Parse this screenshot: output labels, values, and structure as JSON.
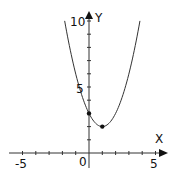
{
  "chart_data": {
    "type": "line",
    "title": "",
    "xlabel": "X",
    "ylabel": "Y",
    "function": "y = x^2 - 2x + 3",
    "xlim": [
      -5.5,
      5.5
    ],
    "ylim": [
      0,
      10
    ],
    "x_tick_labels": [
      "-5",
      "0",
      "5"
    ],
    "y_tick_labels": [
      "5",
      "10"
    ],
    "x_ticks": [
      -5,
      -4,
      -3,
      -2,
      -1,
      0,
      1,
      2,
      3,
      4,
      5
    ],
    "y_ticks": [
      1,
      2,
      3,
      4,
      5,
      6,
      7,
      8,
      9,
      10
    ],
    "grid": false,
    "series": [
      {
        "name": "parabola",
        "x": [
          -1.83,
          -1.5,
          -1,
          -0.5,
          0,
          0.5,
          1,
          1.5,
          2,
          2.5,
          3,
          3.5,
          3.83
        ],
        "y": [
          10,
          8.25,
          6,
          4.25,
          3,
          2.25,
          2,
          2.25,
          3,
          4.25,
          6,
          8.25,
          10
        ]
      }
    ],
    "points": [
      {
        "name": "y-intercept",
        "x": 0,
        "y": 3
      },
      {
        "name": "vertex",
        "x": 1,
        "y": 2
      }
    ]
  },
  "labels": {
    "x_axis": "X",
    "y_axis": "Y",
    "x_min": "-5",
    "origin": "0",
    "x_max": "5",
    "y_mid": "5",
    "y_max": "10"
  }
}
